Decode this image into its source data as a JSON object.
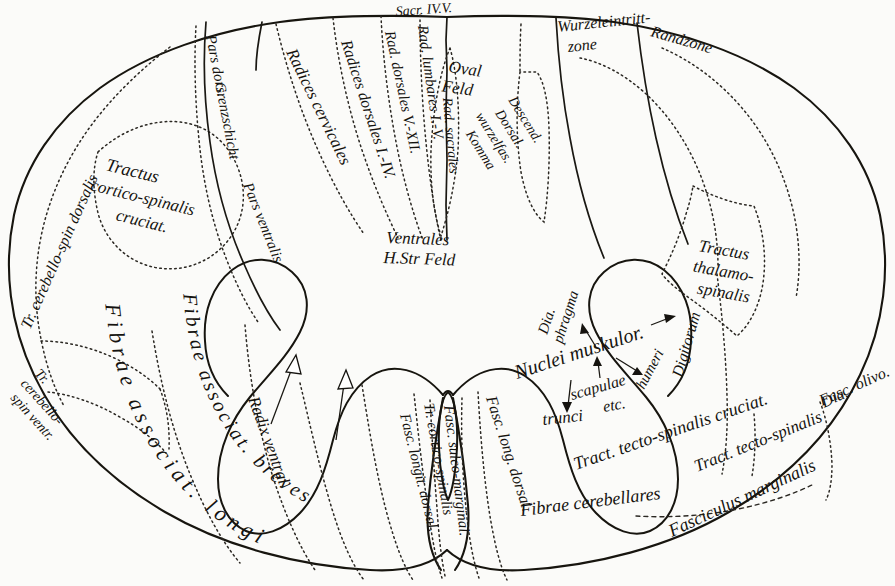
{
  "figure": {
    "style": "antique engraved anatomical plate, italic script labels",
    "colors": {
      "background": "#fbfbf9",
      "ink": "#15130f",
      "outline": "#17150f",
      "dotted_boundary": "#2b2823"
    }
  },
  "labels": {
    "tr_cerebello_spin_dorsalis": "Tr. cerebello-spin dorsalis",
    "tractus_cortico_spinalis_cruciat": "Tractus cortico-spinalis cruciat.",
    "pars_dorsalis": "Pars dors.",
    "grenzschicht": "Grenzschicht",
    "pars_ventralis": "Pars ventralis",
    "radices_cervicales": "Radices cervicales",
    "radices_dorsales_I_IV": "Radices dorsales I.-IV.",
    "rad_dorsales_V_XII": "Rad. dorsales V.-XII.",
    "rad_lumbares_I_V": "Rad. lumbares I.-V.",
    "sacr_IV_V": "Sacr. IV.V.",
    "rad_sacrales": "Rad. sacrales",
    "oval_feld": "Oval Feld",
    "wurzeleintrittzone": "Wurzeleintritt- zone",
    "randzone": "Randzone",
    "descend_dorsal_wurzelfas_komma": "Descend. Dorsal. wurzelfas. Komma",
    "ventrales_h_str_feld": "Ventrales H.Str Feld",
    "tractus_thalamo_spinalis": "Tractus thalamo- spinalis",
    "tr_cerebello_spin_ventr": "Tr. cerebello- spin ventr.",
    "fibrae_associat_longi": "Fibrae associat. longi",
    "fibrae_associat_breves": "Fibrae associat. breves",
    "radix_ventral": "Radix ventral.",
    "fasc_longit_dorsal": "Fasc. longit. dorsal.",
    "tr_cortico_spinalis": "Tr. cortico-spinalis",
    "fasc_sulco_marginal": "Fasc. sulco-marginal.",
    "fasc_long_dorsal": "Fasc. long. dorsal.",
    "fibrae_cerebellares": "Fibrae cerebellares",
    "tract_tecto_spinalis_cruciat": "Tract. tecto-spinalis cruciat.",
    "tract_tecto_spinalis": "Tract. tecto-spinalis",
    "fasciculus_marginalis": "Fasciculus marginalis",
    "fasc_olivo": "Fasc. olivo.",
    "nuclei_muskulor": "Nuclei muskulor.",
    "diaphragma": "Dia- phragma",
    "scapulae": "scapulae",
    "etc": "etc.",
    "humeri": "humeri",
    "digitorum": "Digitorum",
    "trunci": "trunci"
  },
  "label_parts": {
    "diaphragma_1": "Dia.",
    "diaphragma_2": "phragma",
    "humeri_1": "humeri.",
    "digitorum_1": "Digitorum",
    "wurzel_1": "Wurzeleintritt-",
    "wurzel_2": "zone",
    "thalamo_1": "Tractus",
    "thalamo_2": "thalamo-",
    "thalamo_3": "spinalis",
    "cortico_1": "Tractus",
    "cortico_2": "cortico-spinalis",
    "cortico_3": "cruciat.",
    "cerebventr_1": "Tr.",
    "cerebventr_2": "cerebello-",
    "cerebventr_3": "spin ventr.",
    "ventrales_1": "Ventrales",
    "ventrales_2": "H.Str Feld",
    "oval_1": "Oval",
    "oval_2": "Feld",
    "komma_1": "Descend.",
    "komma_2": "Dorsal.",
    "komma_3": "wurzelfas.",
    "komma_4": "Komma"
  }
}
